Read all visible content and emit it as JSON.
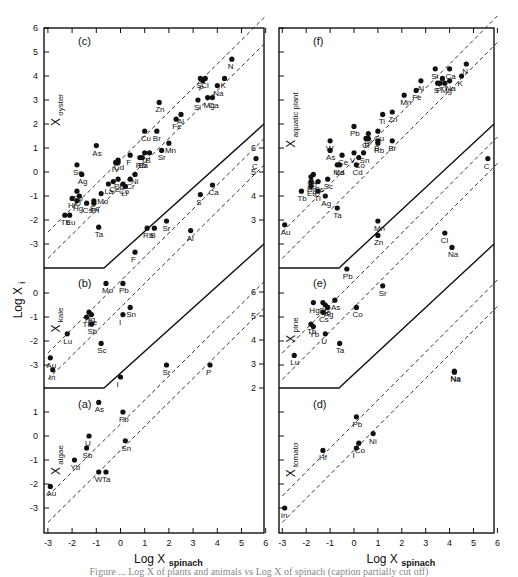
{
  "figure": {
    "y_axis_label": "Log X",
    "y_axis_label_sub": "i",
    "x_axis_label": "Log X",
    "x_axis_label_sub": "spinach",
    "x_ticks": [
      "-3",
      "-2",
      "-1",
      "0",
      "1",
      "2",
      "3",
      "4",
      "5",
      "6"
    ],
    "caption": "Figure ... Log X of plants and animals vs Log X of spinach (caption partially cut off)"
  },
  "chart_data": [
    {
      "type": "scatter",
      "panel": "(c)",
      "title": "X oyster",
      "position": "left-top",
      "xlabel": "Log X spinach",
      "ylabel": "Log X oyster",
      "xlim": [
        -3,
        6
      ],
      "ylim": [
        -3,
        6
      ],
      "points": [
        {
          "label": "N",
          "x": 4.6,
          "y": 4.7
        },
        {
          "label": "S",
          "x": 3.3,
          "y": 3.9
        },
        {
          "label": "Cl",
          "x": 3.5,
          "y": 3.9
        },
        {
          "label": "P",
          "x": 3.4,
          "y": 3.8
        },
        {
          "label": "K",
          "x": 4.3,
          "y": 3.9
        },
        {
          "label": "Na",
          "x": 4.0,
          "y": 3.6
        },
        {
          "label": "Mg",
          "x": 3.6,
          "y": 3.1
        },
        {
          "label": "Ca",
          "x": 3.8,
          "y": 3.1
        },
        {
          "label": "Si",
          "x": 3.2,
          "y": 3.0
        },
        {
          "label": "Zn",
          "x": 1.6,
          "y": 2.9
        },
        {
          "label": "Al",
          "x": 2.5,
          "y": 2.4
        },
        {
          "label": "Fe",
          "x": 2.3,
          "y": 2.2
        },
        {
          "label": "Cu",
          "x": 1.0,
          "y": 1.7
        },
        {
          "label": "Br",
          "x": 1.5,
          "y": 1.7
        },
        {
          "label": "Mn",
          "x": 2.0,
          "y": 1.2
        },
        {
          "label": "Sr",
          "x": 1.7,
          "y": 0.9
        },
        {
          "label": "As",
          "x": -1.0,
          "y": 1.1
        },
        {
          "label": "Ti",
          "x": 1.0,
          "y": 0.8
        },
        {
          "label": "B",
          "x": 1.2,
          "y": 0.8
        },
        {
          "label": "Ba",
          "x": 0.9,
          "y": 0.6
        },
        {
          "label": "Rb",
          "x": 0.8,
          "y": 0.6
        },
        {
          "label": "F",
          "x": 0.4,
          "y": 0.7
        },
        {
          "label": "Cd",
          "x": -0.1,
          "y": 0.5
        },
        {
          "label": "I",
          "x": -0.2,
          "y": 0.4
        },
        {
          "label": "V",
          "x": -0.1,
          "y": 0.4
        },
        {
          "label": "Se",
          "x": -1.8,
          "y": 0.3
        },
        {
          "label": "Ag",
          "x": -1.6,
          "y": -0.1
        },
        {
          "label": "Ni",
          "x": 0.6,
          "y": -0.1
        },
        {
          "label": "Pb",
          "x": -0.1,
          "y": -0.3
        },
        {
          "label": "Cr",
          "x": 0.4,
          "y": -0.3
        },
        {
          "label": "Ce",
          "x": -0.3,
          "y": -0.4
        },
        {
          "label": "La",
          "x": -0.5,
          "y": -0.5
        },
        {
          "label": "Co",
          "x": 0.1,
          "y": -0.5
        },
        {
          "label": "Li",
          "x": 0.2,
          "y": -0.6
        },
        {
          "label": "Sb",
          "x": -1.8,
          "y": -0.8
        },
        {
          "label": "Mo",
          "x": -0.8,
          "y": -0.9
        },
        {
          "label": "U",
          "x": -1.7,
          "y": -1.0
        },
        {
          "label": "Hf",
          "x": -2.0,
          "y": -1.1
        },
        {
          "label": "Hg",
          "x": -1.8,
          "y": -1.2
        },
        {
          "label": "Sc",
          "x": -1.1,
          "y": -1.2
        },
        {
          "label": "Cs",
          "x": -1.4,
          "y": -1.3
        },
        {
          "label": "Th",
          "x": -1.1,
          "y": -1.3
        },
        {
          "label": "Tb",
          "x": -2.3,
          "y": -1.8
        },
        {
          "label": "Eu",
          "x": -2.1,
          "y": -1.8
        },
        {
          "label": "Ta",
          "x": -0.9,
          "y": -2.3
        }
      ]
    },
    {
      "type": "scatter",
      "panel": "(b)",
      "title": "X kale",
      "position": "left-middle",
      "xlabel": "Log X spinach",
      "ylabel": "Log X kale",
      "xlim": [
        -3,
        6
      ],
      "points": [
        {
          "label": "C",
          "x": 5.6,
          "y": 5.6
        },
        {
          "label": "Ca",
          "x": 3.8,
          "y": 4.5
        },
        {
          "label": "S",
          "x": 3.3,
          "y": 4.1
        },
        {
          "label": "Sr",
          "x": 1.9,
          "y": 3.0
        },
        {
          "label": "B",
          "x": 1.4,
          "y": 2.7
        },
        {
          "label": "Rb",
          "x": 1.1,
          "y": 2.7
        },
        {
          "label": "Al",
          "x": 2.9,
          "y": 2.6
        },
        {
          "label": "F",
          "x": 0.6,
          "y": 1.7
        },
        {
          "label": "Mo",
          "x": -0.6,
          "y": 0.4
        },
        {
          "label": "Pb",
          "x": 0.1,
          "y": 0.4
        },
        {
          "label": "Hg",
          "x": -1.3,
          "y": -0.8
        },
        {
          "label": "Se",
          "x": -1.2,
          "y": -0.9
        },
        {
          "label": "Tl",
          "x": -1.4,
          "y": -1.0
        },
        {
          "label": "Sb",
          "x": -1.2,
          "y": -1.3
        },
        {
          "label": "Sn",
          "x": 0.4,
          "y": -0.6
        },
        {
          "label": "I",
          "x": 0.1,
          "y": -0.9
        },
        {
          "label": "Lu",
          "x": -2.2,
          "y": -1.7
        },
        {
          "label": "Sc",
          "x": -0.8,
          "y": -2.1
        },
        {
          "label": "Au",
          "x": -2.9,
          "y": -2.7
        },
        {
          "label": "In",
          "x": -2.8,
          "y": -3.2
        },
        {
          "label": "Sr",
          "x": 1.9,
          "y": -3.0
        },
        {
          "label": "P",
          "x": 3.7,
          "y": -3.0
        },
        {
          "label": "I",
          "x": 0.0,
          "y": -3.5
        }
      ]
    },
    {
      "type": "scatter",
      "panel": "(a)",
      "title": "X algae",
      "position": "left-bottom",
      "xlabel": "Log X spinach",
      "ylabel": "Log X algae",
      "xlim": [
        -3,
        6
      ],
      "ylim": [
        -3,
        2
      ],
      "points": [
        {
          "label": "As",
          "x": -0.9,
          "y": 1.4
        },
        {
          "label": "Pb",
          "x": 0.1,
          "y": 1.0
        },
        {
          "label": "U",
          "x": -1.3,
          "y": 0.0
        },
        {
          "label": "Sn",
          "x": 0.2,
          "y": -0.2
        },
        {
          "label": "Sb",
          "x": -1.4,
          "y": -0.5
        },
        {
          "label": "Yb",
          "x": -1.9,
          "y": -1.0
        },
        {
          "label": "W",
          "x": -0.9,
          "y": -1.5
        },
        {
          "label": "Ta",
          "x": -0.6,
          "y": -1.5
        },
        {
          "label": "Au",
          "x": -2.9,
          "y": -2.1
        }
      ]
    },
    {
      "type": "scatter",
      "panel": "(f)",
      "title": "X aquatic plant",
      "position": "right-top",
      "xlabel": "Log X spinach",
      "ylabel": "Log X aquatic plant",
      "xlim": [
        -3,
        6
      ],
      "ylim": [
        -3,
        6
      ],
      "points": [
        {
          "label": "N",
          "x": 4.7,
          "y": 4.5
        },
        {
          "label": "Si",
          "x": 3.4,
          "y": 4.3
        },
        {
          "label": "Ca",
          "x": 4.0,
          "y": 4.3
        },
        {
          "label": "Cl",
          "x": 3.7,
          "y": 3.9
        },
        {
          "label": "K",
          "x": 4.5,
          "y": 4.0
        },
        {
          "label": "S",
          "x": 3.5,
          "y": 3.7
        },
        {
          "label": "P",
          "x": 3.6,
          "y": 3.7
        },
        {
          "label": "Na",
          "x": 4.0,
          "y": 3.8
        },
        {
          "label": "Mg",
          "x": 3.8,
          "y": 3.7
        },
        {
          "label": "Al",
          "x": 2.8,
          "y": 3.8
        },
        {
          "label": "Mn",
          "x": 2.1,
          "y": 3.2
        },
        {
          "label": "Fe",
          "x": 2.6,
          "y": 3.4
        },
        {
          "label": "Ti",
          "x": 1.2,
          "y": 2.4
        },
        {
          "label": "Zn",
          "x": 1.6,
          "y": 2.5
        },
        {
          "label": "Pb",
          "x": 0.0,
          "y": 1.9
        },
        {
          "label": "Cu",
          "x": 1.0,
          "y": 1.7
        },
        {
          "label": "Ni",
          "x": 0.6,
          "y": 1.6
        },
        {
          "label": "Cr",
          "x": 0.5,
          "y": 1.4
        },
        {
          "label": "F",
          "x": 0.6,
          "y": 1.4
        },
        {
          "label": "B",
          "x": 1.0,
          "y": 1.3
        },
        {
          "label": "Br",
          "x": 1.6,
          "y": 1.3
        },
        {
          "label": "Rb",
          "x": 1.0,
          "y": 1.2
        },
        {
          "label": "W",
          "x": -1.0,
          "y": 1.3
        },
        {
          "label": "As",
          "x": -1.0,
          "y": 0.9
        },
        {
          "label": "V",
          "x": 0.0,
          "y": 0.8
        },
        {
          "label": "Ce",
          "x": -0.5,
          "y": 0.7
        },
        {
          "label": "Sn",
          "x": 0.4,
          "y": 0.8
        },
        {
          "label": "Co",
          "x": 0.2,
          "y": 0.6
        },
        {
          "label": "Cd",
          "x": 0.1,
          "y": 0.3
        },
        {
          "label": "Mo",
          "x": -0.7,
          "y": 0.3
        },
        {
          "label": "La",
          "x": -0.6,
          "y": 0.3
        },
        {
          "label": "Se",
          "x": -1.7,
          "y": -0.1
        },
        {
          "label": "Sb",
          "x": -1.8,
          "y": -0.2
        },
        {
          "label": "Sc",
          "x": -1.1,
          "y": -0.3
        },
        {
          "label": "Hg",
          "x": -1.8,
          "y": -0.4
        },
        {
          "label": "Cs",
          "x": -1.5,
          "y": -0.4
        },
        {
          "label": "Eu",
          "x": -1.8,
          "y": -0.6
        },
        {
          "label": "Tb",
          "x": -2.2,
          "y": -0.8
        },
        {
          "label": "Tl",
          "x": -1.5,
          "y": -0.8
        },
        {
          "label": "Ag",
          "x": -1.2,
          "y": -1.0
        },
        {
          "label": "Ta",
          "x": -0.7,
          "y": -1.5
        },
        {
          "label": "Au",
          "x": -2.9,
          "y": -2.2
        }
      ]
    },
    {
      "type": "scatter",
      "panel": "(e)",
      "title": "X pine",
      "position": "right-middle",
      "xlabel": "Log X spinach",
      "ylabel": "Log X pine",
      "xlim": [
        -3,
        6
      ],
      "points": [
        {
          "label": "C",
          "x": 5.6,
          "y": 5.6
        },
        {
          "label": "Mn",
          "x": 1.0,
          "y": 3.0
        },
        {
          "label": "Cl",
          "x": 3.8,
          "y": 2.5
        },
        {
          "label": "Na",
          "x": 4.1,
          "y": 1.9
        },
        {
          "label": "Zn",
          "x": 1.0,
          "y": 2.4
        },
        {
          "label": "Pb",
          "x": -0.3,
          "y": 1.0
        },
        {
          "label": "Sr",
          "x": 1.2,
          "y": 0.3
        },
        {
          "label": "Co",
          "x": 0.1,
          "y": -0.6
        },
        {
          "label": "Sb",
          "x": -1.3,
          "y": -0.4
        },
        {
          "label": "Hg",
          "x": -1.7,
          "y": -0.4
        },
        {
          "label": "Se",
          "x": -1.2,
          "y": -0.5
        },
        {
          "label": "Ag",
          "x": -1.1,
          "y": -0.6
        },
        {
          "label": "As",
          "x": -0.8,
          "y": -0.3
        },
        {
          "label": "Cs",
          "x": -1.3,
          "y": -0.8
        },
        {
          "label": "Tb",
          "x": -1.8,
          "y": -1.3
        },
        {
          "label": "Yb",
          "x": -1.7,
          "y": -1.4
        },
        {
          "label": "U",
          "x": -1.2,
          "y": -1.7
        },
        {
          "label": "Ta",
          "x": -0.6,
          "y": -2.1
        },
        {
          "label": "Lu",
          "x": -2.5,
          "y": -2.6
        },
        {
          "label": "Na",
          "x": 4.2,
          "y": -3.3
        }
      ]
    },
    {
      "type": "scatter",
      "panel": "(d)",
      "title": "X tomato",
      "position": "right-bottom",
      "xlabel": "Log X spinach",
      "ylabel": "Log X tomato",
      "xlim": [
        -3,
        6
      ],
      "ylim": [
        -3,
        2
      ],
      "points": [
        {
          "label": "Pb",
          "x": 0.1,
          "y": 0.8
        },
        {
          "label": "Ni",
          "x": 0.8,
          "y": 0.1
        },
        {
          "label": "Co",
          "x": 0.2,
          "y": -0.3
        },
        {
          "label": "I",
          "x": 0.1,
          "y": -0.5
        },
        {
          "label": "Hf",
          "x": -1.3,
          "y": -0.6
        },
        {
          "label": "In",
          "x": -2.9,
          "y": -3.0
        },
        {
          "label": "Na",
          "x": 4.2,
          "y": 2.7
        }
      ]
    }
  ]
}
